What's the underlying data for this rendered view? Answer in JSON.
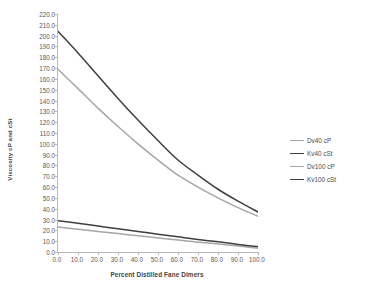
{
  "chart_data": {
    "type": "line",
    "title": "",
    "xlabel": "Percent Distilled Fane Dimers",
    "ylabel": "Viscosity cP and cSt",
    "xlim": [
      0,
      100
    ],
    "ylim": [
      0,
      220
    ],
    "grid": false,
    "legend_position": "right",
    "x_ticks": [
      "0.0",
      "10.0",
      "20.0",
      "30.0",
      "40.0",
      "50.0",
      "60.0",
      "70.0",
      "80.0",
      "90.0",
      "100.0"
    ],
    "y_ticks": [
      "0.0",
      "10.0",
      "20.0",
      "30.0",
      "40.0",
      "50.0",
      "60.0",
      "70.0",
      "80.0",
      "90.0",
      "100.0",
      "110.0",
      "120.0",
      "130.0",
      "140.0",
      "150.0",
      "160.0",
      "170.0",
      "180.0",
      "190.0",
      "200.0",
      "210.0",
      "220.0"
    ],
    "x": [
      0,
      10,
      20,
      30,
      40,
      50,
      60,
      70,
      80,
      90,
      100
    ],
    "series": [
      {
        "name": "Dv40 cP",
        "color": "#a6a6a6",
        "values": [
          169.0,
          151.0,
          133.0,
          116.0,
          100.0,
          85.0,
          71.0,
          60.0,
          50.0,
          41.0,
          33.0
        ]
      },
      {
        "name": "Kv40 cSt",
        "color": "#3f3f3f",
        "values": [
          204.0,
          184.0,
          163.0,
          142.0,
          122.0,
          103.0,
          85.0,
          71.0,
          58.0,
          47.0,
          37.0
        ]
      },
      {
        "name": "Dv100 cP",
        "color": "#a6a6a6",
        "values": [
          23.0,
          21.0,
          19.0,
          17.0,
          15.0,
          13.0,
          11.0,
          9.0,
          7.5,
          5.5,
          3.5
        ]
      },
      {
        "name": "Kv100 cSt",
        "color": "#3f3f3f",
        "values": [
          29.0,
          26.5,
          24.0,
          21.5,
          19.0,
          16.5,
          14.0,
          11.5,
          9.5,
          7.0,
          5.0
        ]
      }
    ]
  },
  "colors": {
    "axis": "#b8b8b8",
    "tick_text": "#595959",
    "title_text": "#3f3f3f",
    "series_light": "#a6a6a6",
    "series_dark": "#3f3f3f",
    "background": "#ffffff"
  }
}
